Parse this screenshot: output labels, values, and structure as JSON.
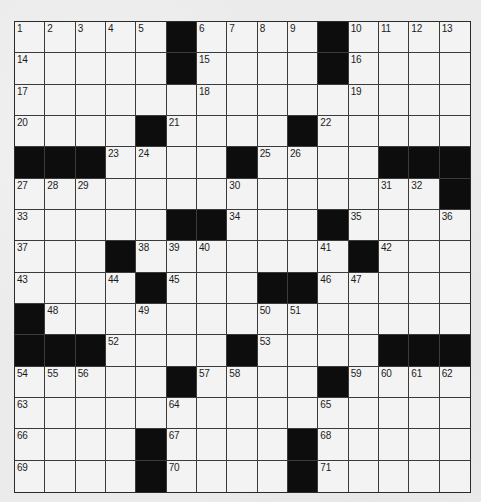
{
  "puzzle": {
    "type": "crossword",
    "size": {
      "rows": 15,
      "cols": 15
    },
    "colors": {
      "block": "#0d0d0d",
      "cell": "#f3f3f3",
      "line": "#3a3a3a",
      "paper": "#ebebeb"
    },
    "grid": [
      [
        "1",
        "2",
        "3",
        "4",
        "5",
        "#",
        "6",
        "7",
        "8",
        "9",
        "#",
        "10",
        "11",
        "12",
        "13"
      ],
      [
        "14",
        "",
        "",
        "",
        "",
        "#",
        "15",
        "",
        "",
        "",
        "#",
        "16",
        "",
        "",
        ""
      ],
      [
        "17",
        "",
        "",
        "",
        "",
        "",
        "18",
        "",
        "",
        "",
        "",
        "19",
        "",
        "",
        ""
      ],
      [
        "20",
        "",
        "",
        "",
        "#",
        "21",
        "",
        "",
        "",
        "#",
        "22",
        "",
        "",
        "",
        ""
      ],
      [
        "#",
        "#",
        "#",
        "23",
        "24",
        "",
        "",
        "#",
        "25",
        "26",
        "",
        "",
        "#",
        "#",
        "#"
      ],
      [
        "27",
        "28",
        "29",
        "",
        "",
        "",
        "",
        "30",
        "",
        "",
        "",
        "",
        "31",
        "32",
        "#"
      ],
      [
        "33",
        "",
        "",
        "",
        "",
        "#",
        "#",
        "34",
        "",
        "",
        "#",
        "35",
        "",
        "",
        "36"
      ],
      [
        "37",
        "",
        "",
        "#",
        "38",
        "39",
        "40",
        "",
        "",
        "",
        "41",
        "#",
        "42",
        "",
        ""
      ],
      [
        "43",
        "",
        "",
        "44",
        "#",
        "45",
        "",
        "",
        "#",
        "#",
        "46",
        "47",
        "",
        "",
        ""
      ],
      [
        "#",
        "48",
        "",
        "",
        "49",
        "",
        "",
        "",
        "50",
        "51",
        "",
        "",
        "",
        "",
        ""
      ],
      [
        "#",
        "#",
        "#",
        "52",
        "",
        "",
        "",
        "#",
        "53",
        "",
        "",
        "",
        "#",
        "#",
        "#"
      ],
      [
        "54",
        "55",
        "56",
        "",
        "",
        "#",
        "57",
        "58",
        "",
        "",
        "#",
        "59",
        "60",
        "61",
        "62"
      ],
      [
        "63",
        "",
        "",
        "",
        "",
        "64",
        "",
        "",
        "",
        "",
        "65",
        "",
        "",
        "",
        ""
      ],
      [
        "66",
        "",
        "",
        "",
        "#",
        "67",
        "",
        "",
        "",
        "#",
        "68",
        "",
        "",
        "",
        ""
      ],
      [
        "69",
        "",
        "",
        "",
        "#",
        "70",
        "",
        "",
        "",
        "#",
        "71",
        "",
        "",
        "",
        ""
      ]
    ],
    "clue_numbers": {
      "across": [
        "1",
        "6",
        "10",
        "14",
        "15",
        "16",
        "17",
        "20",
        "21",
        "22",
        "23",
        "25",
        "27",
        "33",
        "34",
        "35",
        "37",
        "38",
        "42",
        "43",
        "45",
        "46",
        "48",
        "52",
        "53",
        "54",
        "57",
        "59",
        "63",
        "66",
        "67",
        "68",
        "69",
        "70",
        "71"
      ],
      "down": [
        "1",
        "2",
        "3",
        "4",
        "5",
        "6",
        "7",
        "8",
        "9",
        "10",
        "11",
        "12",
        "13",
        "18",
        "19",
        "24",
        "26",
        "27",
        "28",
        "29",
        "30",
        "31",
        "32",
        "36",
        "39",
        "40",
        "41",
        "44",
        "47",
        "49",
        "50",
        "51",
        "54",
        "55",
        "56",
        "58",
        "60",
        "61",
        "62",
        "64",
        "65"
      ]
    }
  }
}
